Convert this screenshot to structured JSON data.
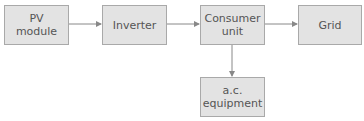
{
  "diagram": {
    "nodes": [
      {
        "id": "pv",
        "label": "PV\nmodule"
      },
      {
        "id": "inverter",
        "label": "Inverter"
      },
      {
        "id": "consumer",
        "label": "Consumer\nunit"
      },
      {
        "id": "grid",
        "label": "Grid"
      },
      {
        "id": "ac",
        "label": "a.c.\nequipment"
      }
    ],
    "edges": [
      {
        "from": "pv",
        "to": "inverter"
      },
      {
        "from": "inverter",
        "to": "consumer"
      },
      {
        "from": "consumer",
        "to": "grid"
      },
      {
        "from": "consumer",
        "to": "ac"
      }
    ],
    "colors": {
      "box_fill": "#e3e3e3",
      "box_border": "#a9a9a9",
      "arrow": "#888888",
      "text": "#555555"
    }
  }
}
